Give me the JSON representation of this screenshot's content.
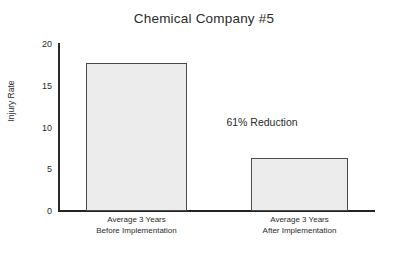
{
  "chart_data": {
    "type": "bar",
    "title": "Chemical Company #5",
    "xlabel": "",
    "ylabel": "Injury Rate",
    "categories": [
      "Average 3 Years Before Implementation",
      "Average 3 Years After Implementation"
    ],
    "category_lines": [
      [
        "Average 3 Years",
        "Before Implementation"
      ],
      [
        "Average 3 Years",
        "After Implementation"
      ]
    ],
    "values": [
      17.7,
      6.3
    ],
    "ylim": [
      0,
      20
    ],
    "yticks": [
      0,
      5,
      10,
      15,
      20
    ],
    "ytick_labels": [
      "0",
      "5",
      "10",
      "15",
      "20"
    ],
    "grid": false,
    "legend": false,
    "annotations": [
      {
        "text": "61% Reduction",
        "x_px": 262,
        "y_px": 122
      }
    ],
    "bar_fill_color": "#ececec",
    "bar_edge_color": "#4a4a4a",
    "axis_color": "#232323",
    "background_color": "#ffffff"
  }
}
